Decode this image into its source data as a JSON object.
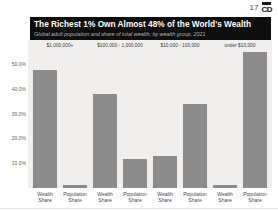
{
  "header": {
    "page_number": "17",
    "logo_text": "CD"
  },
  "banner": {
    "title": "The Richest 1% Own Almost 48% of the World's Wealth",
    "subtitle": "Global adult population and share of total wealth, by wealth group, 2021"
  },
  "chart_data": {
    "type": "bar",
    "title": "The Richest 1% Own Almost 48% of the World's Wealth",
    "subtitle": "Global adult population and share of total wealth, by wealth group, 2021",
    "groups": [
      "$1,000,000+",
      "$100,000 - 1,000,000",
      "$10,000 - 100,000",
      "under $10,000"
    ],
    "bar_labels": [
      "Wealth Share",
      "Population Share"
    ],
    "series": [
      {
        "name": "Wealth Share",
        "values": [
          47.8,
          38.2,
          13.0,
          1.3
        ]
      },
      {
        "name": "Population Share",
        "values": [
          1.2,
          11.8,
          34.2,
          55.3
        ]
      }
    ],
    "y_ticks": [
      "50.0%",
      "40.0%",
      "30.0%",
      "20.0%",
      "10.0%"
    ],
    "ylim": [
      0,
      60
    ],
    "grid": false,
    "legend": "none",
    "bar_color": "#8c8c8c",
    "plot_bg": "#f1efed",
    "banner_bg": "#0e0e0e"
  }
}
